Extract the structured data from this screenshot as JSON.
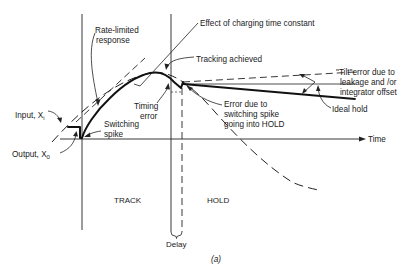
{
  "figure": {
    "caption": "(a)",
    "axis": {
      "time_label": "Time"
    },
    "phases": {
      "track": "TRACK",
      "hold": "HOLD",
      "delay": "Delay"
    },
    "labels": {
      "input": "Input, X",
      "input_sub": "i",
      "output": "Output, X",
      "output_sub": "0",
      "rate_limited_1": "Rate-limited",
      "rate_limited_2": "response",
      "charging": "Effect of charging time constant",
      "tracking": "Tracking achieved",
      "timing_1": "Timing",
      "timing_2": "error",
      "switching_1": "Switching",
      "switching_2": "spike",
      "spike_err_1": "Error due to",
      "spike_err_2": "switching spike",
      "spike_err_3": "going into HOLD",
      "tilt_1": "\"Tilt\"error due to",
      "tilt_2": "leakage and /or",
      "tilt_3": "integrator offset",
      "ideal_hold": "Ideal hold"
    }
  }
}
